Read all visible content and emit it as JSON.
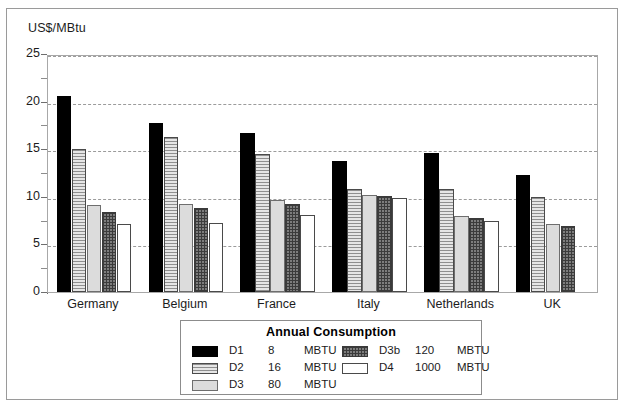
{
  "chart_data": {
    "type": "bar",
    "title": "",
    "xlabel": "",
    "ylabel": "US$/MBtu",
    "ylim": [
      0,
      25
    ],
    "yticks": [
      "0",
      "5",
      "10",
      "15",
      "20",
      "25"
    ],
    "ytick_values": [
      0,
      5,
      10,
      15,
      20,
      25
    ],
    "minor_tick_values": [
      2.5,
      7.5,
      12.5,
      17.5,
      22.5
    ],
    "grid": true,
    "grid_axis": "y",
    "legend_position": "below-center",
    "categories": [
      "Germany",
      "Belgium",
      "France",
      "Italy",
      "Netherlands",
      "UK"
    ],
    "series": [
      {
        "name": "D1",
        "values": [
          20.6,
          17.8,
          16.7,
          13.8,
          14.6,
          12.3
        ]
      },
      {
        "name": "D2",
        "values": [
          15.0,
          16.3,
          14.5,
          10.8,
          10.8,
          10.0
        ]
      },
      {
        "name": "D3",
        "values": [
          9.1,
          9.2,
          9.7,
          10.2,
          8.0,
          7.1
        ]
      },
      {
        "name": "D3b",
        "values": [
          8.4,
          8.8,
          9.2,
          10.1,
          7.8,
          6.9
        ]
      },
      {
        "name": "D4",
        "values": [
          7.1,
          7.2,
          8.1,
          9.9,
          7.5,
          null
        ]
      }
    ]
  },
  "axis": {
    "y_title": "US$/MBtu"
  },
  "legend": {
    "title": "Annual Consumption",
    "left_column": [
      {
        "code": "D1",
        "value": "8",
        "unit": "MBTU",
        "swatch": "solid-black-swatch"
      },
      {
        "code": "D2",
        "value": "16",
        "unit": "MBTU",
        "swatch": "horizontal-stripe-swatch"
      },
      {
        "code": "D3",
        "value": "80",
        "unit": "MBTU",
        "swatch": "light-gray-swatch"
      }
    ],
    "right_column": [
      {
        "code": "D3b",
        "value": "120",
        "unit": "MBTU",
        "swatch": "dark-crosshatch-swatch"
      },
      {
        "code": "D4",
        "value": "1000",
        "unit": "MBTU",
        "swatch": "white-swatch"
      }
    ]
  }
}
